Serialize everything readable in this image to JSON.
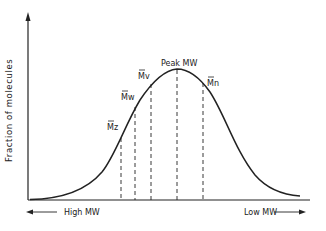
{
  "diagram": {
    "type": "molecular weight distribution curve",
    "y_axis_label": "Fraction of molecules",
    "x_axis_left_label": "High MW",
    "x_axis_right_label": "Low MW",
    "markers": [
      {
        "id": "mz",
        "label": "Mz",
        "overbar": true
      },
      {
        "id": "mw",
        "label": "Mw",
        "overbar": true
      },
      {
        "id": "mv",
        "label": "Mv",
        "overbar": true
      },
      {
        "id": "peak",
        "label": "Peak MW",
        "overbar": false
      },
      {
        "id": "mn",
        "label": "Mn",
        "overbar": true
      }
    ],
    "colors": {
      "line": "#222222",
      "background": "#ffffff"
    }
  }
}
